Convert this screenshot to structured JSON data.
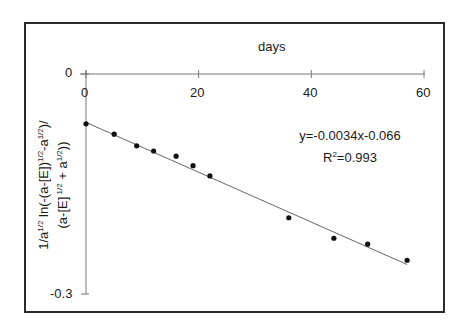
{
  "chart_data": {
    "type": "scatter",
    "title": "",
    "xlabel": "days",
    "ylabel": "1/a^1/2 ln(-(a-[E])^1/2-a^1/2)/(a-[E]^1/2 + a^1/2))",
    "ylabel_lines": [
      "1/a",
      "1/2",
      " ln(-(a-[E])",
      "1/2",
      "-a",
      "1/2",
      ")/",
      "(a-[E]",
      " 1/2",
      " + a",
      "1/2",
      "))"
    ],
    "xlim": [
      0,
      60
    ],
    "ylim": [
      -0.3,
      0
    ],
    "x_ticks": [
      0,
      20,
      40,
      60
    ],
    "x_tick_labels": [
      "0",
      "20",
      "40",
      "60"
    ],
    "y_ticks": [
      0,
      -0.3
    ],
    "y_tick_labels": [
      "0",
      "-0.3"
    ],
    "x_axis_position": "top",
    "grid": false,
    "legend": null,
    "series": [
      {
        "name": "data",
        "marker": "circle",
        "x": [
          0,
          5,
          9,
          12,
          16,
          19,
          22,
          36,
          44,
          50,
          57
        ],
        "y": [
          -0.068,
          -0.082,
          -0.098,
          -0.105,
          -0.112,
          -0.125,
          -0.139,
          -0.196,
          -0.224,
          -0.232,
          -0.254
        ]
      }
    ],
    "trendline": {
      "type": "linear",
      "slope": -0.0034,
      "intercept": -0.066,
      "x_range": [
        0,
        57
      ]
    },
    "annotations": [
      {
        "text": "y=-0.0034x-0.066"
      },
      {
        "text": "R2=0.993"
      }
    ]
  },
  "labels": {
    "x_axis_title": "days",
    "equation": "y=-0.0034x-0.066",
    "r2_prefix": "R",
    "r2_sup": "2",
    "r2_value": "=0.993",
    "y_tick_zero": "0",
    "y_tick_min": "-0.3",
    "x_tick_0": "0",
    "x_tick_20": "20",
    "x_tick_40": "40",
    "x_tick_60": "60",
    "ylabel_l1_a": "1/a",
    "ylabel_l1_b": "1/2",
    "ylabel_l1_c": " ln(-(a-[E])",
    "ylabel_l1_d": "1/2",
    "ylabel_l1_e": "-a",
    "ylabel_l1_f": "1/2",
    "ylabel_l1_g": ")/",
    "ylabel_l2_a": "(a-[E]",
    "ylabel_l2_b": " 1/2",
    "ylabel_l2_c": " + a",
    "ylabel_l2_d": "1/2",
    "ylabel_l2_e": "))"
  },
  "colors": {
    "frame": "#2a2a2a",
    "axis": "#777777",
    "trendline": "#666666",
    "marker": "#111111",
    "text": "#1a1a1a"
  }
}
